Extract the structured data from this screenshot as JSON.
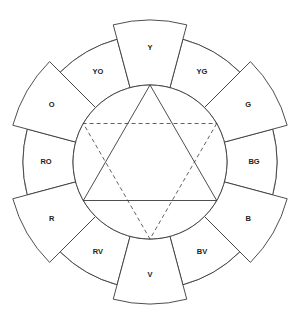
{
  "diagram": {
    "type": "color-wheel",
    "segments": [
      {
        "label": "Y",
        "kind": "primary"
      },
      {
        "label": "YG",
        "kind": "tertiary"
      },
      {
        "label": "G",
        "kind": "secondary"
      },
      {
        "label": "BG",
        "kind": "tertiary"
      },
      {
        "label": "B",
        "kind": "primary"
      },
      {
        "label": "BV",
        "kind": "tertiary"
      },
      {
        "label": "V",
        "kind": "secondary"
      },
      {
        "label": "RV",
        "kind": "tertiary"
      },
      {
        "label": "R",
        "kind": "primary"
      },
      {
        "label": "RO",
        "kind": "tertiary"
      },
      {
        "label": "O",
        "kind": "secondary"
      },
      {
        "label": "YO",
        "kind": "tertiary"
      }
    ],
    "triangles": [
      {
        "name": "primary-triangle",
        "style": "solid",
        "vertices": [
          "Y",
          "B",
          "R"
        ]
      },
      {
        "name": "secondary-triangle",
        "style": "dashed",
        "vertices": [
          "G",
          "V",
          "O"
        ]
      }
    ]
  }
}
